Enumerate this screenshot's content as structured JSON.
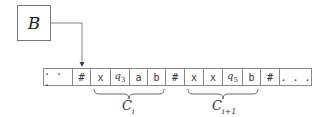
{
  "state_box": {
    "label": "B"
  },
  "tape": {
    "cells": [
      {
        "text": "...",
        "width": 30
      },
      {
        "text": "#",
        "width": 18
      },
      {
        "text": "x",
        "width": 20
      },
      {
        "text": "q",
        "sub": "3",
        "width": 19
      },
      {
        "text": "a",
        "width": 18
      },
      {
        "text": "b",
        "width": 18
      },
      {
        "text": "#",
        "width": 19
      },
      {
        "text": "x",
        "width": 19
      },
      {
        "text": "x",
        "width": 19
      },
      {
        "text": "q",
        "sub": "5",
        "width": 20
      },
      {
        "text": "b",
        "width": 18
      },
      {
        "text": "#",
        "width": 19
      },
      {
        "text": "...",
        "width": 32
      }
    ],
    "head_position_cell": 1
  },
  "braces": [
    {
      "label": "C",
      "sub": "i",
      "from_cell": 2,
      "to_cell": 5
    },
    {
      "label": "C",
      "sub": "i+1",
      "from_cell": 7,
      "to_cell": 10
    }
  ],
  "colors": {
    "line": "#666666",
    "border": "#888888"
  }
}
